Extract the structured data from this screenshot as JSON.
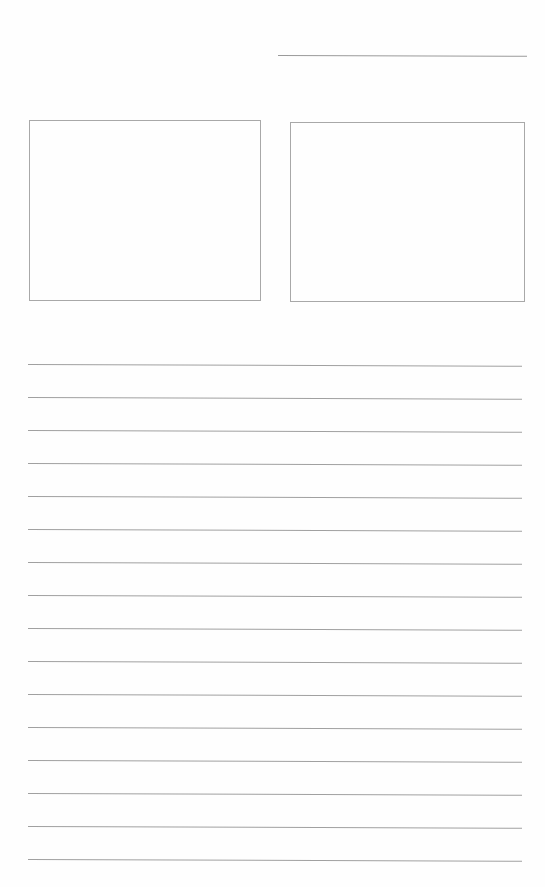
{
  "page": {
    "background": "#fefefe",
    "line_color": "#a0a0a0"
  },
  "header": {
    "name_line": {
      "x": 278,
      "y": 55,
      "width": 249
    }
  },
  "frames": [
    {
      "id": "left",
      "x": 29,
      "y": 120,
      "width": 232,
      "height": 181
    },
    {
      "id": "right",
      "x": 290,
      "y": 122,
      "width": 235,
      "height": 180
    }
  ],
  "ruled_lines": {
    "count": 16,
    "x": 28,
    "width": 494,
    "positions_y": [
      364,
      397,
      430,
      463,
      496,
      529,
      562,
      595,
      628,
      661,
      694,
      727,
      760,
      793,
      826,
      859
    ]
  }
}
